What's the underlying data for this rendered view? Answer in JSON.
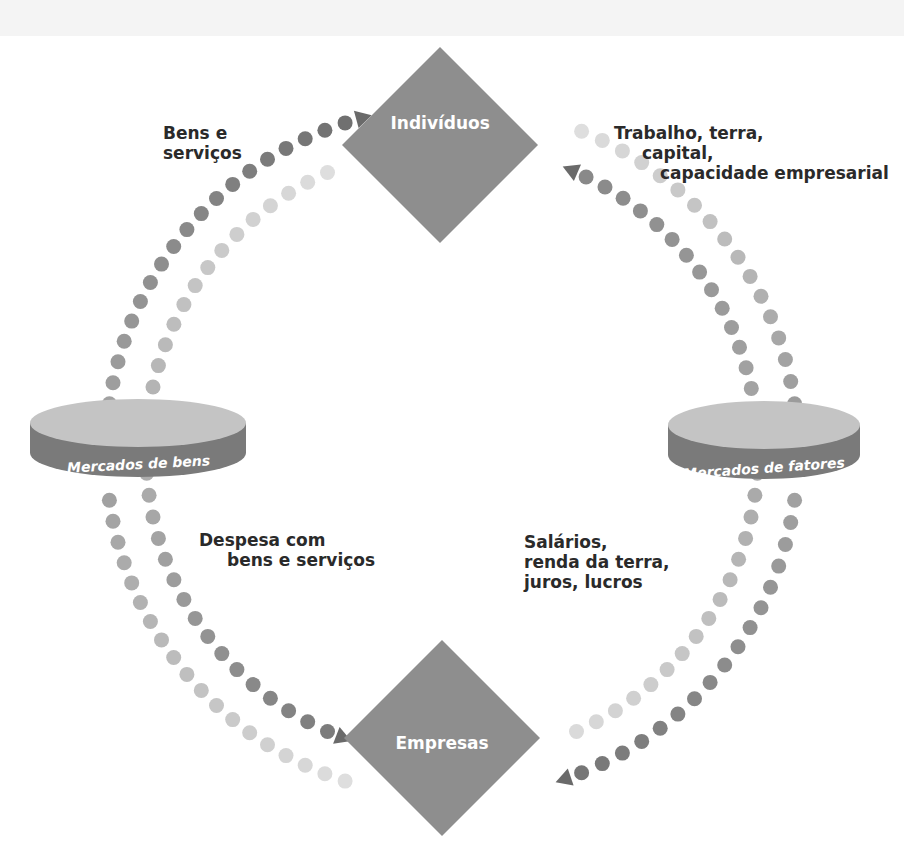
{
  "nodes": {
    "households": {
      "label": "Indivíduos",
      "cx": 440,
      "cy": 145,
      "half": 98
    },
    "firms": {
      "label": "Empresas",
      "cx": 442,
      "cy": 738,
      "half": 98
    }
  },
  "markets": {
    "goods": {
      "label": "Mercados de bens",
      "cx": 138,
      "cy": 438,
      "rx": 108,
      "ry": 24,
      "band": 30
    },
    "factors": {
      "label": "Mercados de fatores",
      "cx": 764,
      "cy": 440,
      "rx": 96,
      "ry": 24,
      "band": 30
    }
  },
  "flow_labels": {
    "goods_to_households": [
      "Bens e",
      "serviços"
    ],
    "factors_from_households": [
      "Trabalho, terra,",
      "capital,",
      "capacidade empresarial"
    ],
    "spending": [
      "Despesa com",
      "bens e serviços"
    ],
    "income": [
      "Salários,",
      "renda da terra,",
      "juros, lucros"
    ]
  },
  "rings": {
    "center": [
      452,
      452
    ],
    "outer_radius": 346,
    "inner_radius": 306
  },
  "colors": {
    "node_fill": "#8e8e8e",
    "cylinder_top": "#c4c4c4",
    "cylinder_band": "#7a7a7a",
    "dot_dark": "#6a6a6a",
    "dot_light": "#e2e2e2",
    "arrow": "#6a6a6a",
    "text": "#2a2a2a"
  },
  "arcs": [
    {
      "name": "outer-left-top",
      "ring": "outer",
      "from": 188,
      "to": 252,
      "shade_from": 0.45,
      "shade_to": 0.05,
      "arrow_end": true
    },
    {
      "name": "inner-left-top",
      "ring": "inner",
      "from": 184,
      "to": 246,
      "shade_from": 0.55,
      "shade_to": 0.95,
      "arrow_end": false
    },
    {
      "name": "outer-left-bottom",
      "ring": "outer",
      "from": 172,
      "to": 108,
      "shade_from": 0.45,
      "shade_to": 0.95,
      "arrow_end": false
    },
    {
      "name": "inner-left-bottom",
      "ring": "inner",
      "from": 176,
      "to": 114,
      "shade_from": 0.55,
      "shade_to": 0.15,
      "arrow_end": true
    },
    {
      "name": "outer-right-top",
      "ring": "outer",
      "from": 352,
      "to": 292,
      "shade_from": 0.4,
      "shade_to": 0.95,
      "arrow_end": false
    },
    {
      "name": "inner-right-top",
      "ring": "inner",
      "from": 356,
      "to": 296,
      "shade_from": 0.5,
      "shade_to": 0.25,
      "arrow_end": true
    },
    {
      "name": "outer-right-bottom",
      "ring": "outer",
      "from": 8,
      "to": 68,
      "shade_from": 0.45,
      "shade_to": 0.1,
      "arrow_end": true
    },
    {
      "name": "inner-right-bottom",
      "ring": "inner",
      "from": 4,
      "to": 66,
      "shade_from": 0.5,
      "shade_to": 0.92,
      "arrow_end": false
    }
  ]
}
